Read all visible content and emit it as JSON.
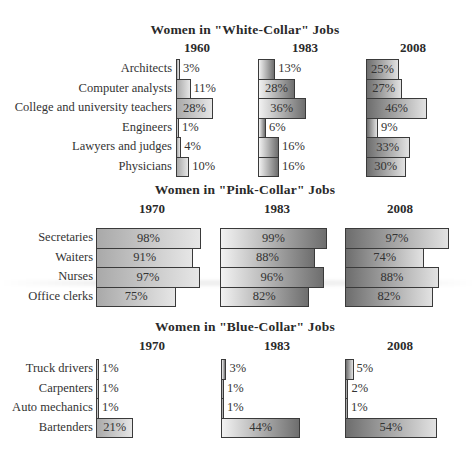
{
  "chart_data": [
    {
      "type": "bar",
      "orientation": "horizontal",
      "title": "Women in \"White-Collar\" Jobs",
      "categories": [
        "Architects",
        "Computer analysts",
        "College and university teachers",
        "Engineers",
        "Lawyers and judges",
        "Physicians"
      ],
      "series": [
        {
          "name": "1960",
          "values": [
            3,
            11,
            28,
            1,
            4,
            10
          ],
          "labels": [
            "3%",
            "11%",
            "28%",
            "1%",
            "4%",
            "10%"
          ]
        },
        {
          "name": "1983",
          "values": [
            13,
            28,
            36,
            6,
            16,
            16
          ],
          "labels": [
            "13%",
            "28%",
            "36%",
            "6%",
            "16%",
            "16%"
          ]
        },
        {
          "name": "2008",
          "values": [
            25,
            27,
            46,
            9,
            33,
            30
          ],
          "labels": [
            "25%",
            "27%",
            "46%",
            "9%",
            "33%",
            "30%"
          ]
        }
      ],
      "unit": "%",
      "grid": false,
      "legend": "none"
    },
    {
      "type": "bar",
      "orientation": "horizontal",
      "title": "Women in \"Pink-Collar\" Jobs",
      "categories": [
        "Secretaries",
        "Waiters",
        "Nurses",
        "Office clerks"
      ],
      "series": [
        {
          "name": "1970",
          "values": [
            98,
            91,
            97,
            75
          ],
          "labels": [
            "98%",
            "91%",
            "97%",
            "75%"
          ]
        },
        {
          "name": "1983",
          "values": [
            99,
            88,
            96,
            82
          ],
          "labels": [
            "99%",
            "88%",
            "96%",
            "82%"
          ]
        },
        {
          "name": "2008",
          "values": [
            97,
            74,
            88,
            82
          ],
          "labels": [
            "97%",
            "74%",
            "88%",
            "82%"
          ]
        }
      ],
      "unit": "%",
      "grid": false,
      "legend": "none"
    },
    {
      "type": "bar",
      "orientation": "horizontal",
      "title": "Women in \"Blue-Collar\" Jobs",
      "categories": [
        "Truck drivers",
        "Carpenters",
        "Auto mechanics",
        "Bartenders"
      ],
      "series": [
        {
          "name": "1970",
          "values": [
            1,
            1,
            1,
            21
          ],
          "labels": [
            "1%",
            "1%",
            "1%",
            "21%"
          ]
        },
        {
          "name": "1983",
          "values": [
            3,
            1,
            1,
            44
          ],
          "labels": [
            "3%",
            "1%",
            "1%",
            "44%"
          ]
        },
        {
          "name": "2008",
          "values": [
            5,
            2,
            1,
            54
          ],
          "labels": [
            "5%",
            "2%",
            "1%",
            "54%"
          ]
        }
      ],
      "unit": "%",
      "grid": false,
      "legend": "none"
    }
  ],
  "colors": {
    "bar_border": "#3a3a3a",
    "first_period_gradient": [
      "#a9a9a9",
      "#e6e6e6"
    ],
    "1983_gradient": [
      "#f2f2f2",
      "#6e6e6e"
    ],
    "2008_gradient": [
      "#6d6d6d",
      "#e2e2e2"
    ]
  }
}
